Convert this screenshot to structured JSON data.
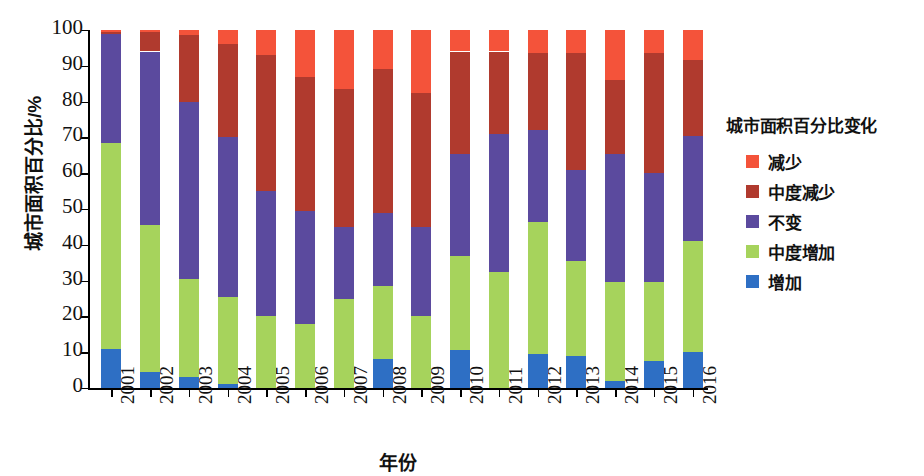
{
  "chart_data": {
    "type": "bar",
    "subtype": "stacked-percentage",
    "title": "",
    "xlabel": "年份",
    "ylabel": "城市面积百分比/%",
    "ylim": [
      0,
      100
    ],
    "yticks": [
      0,
      10,
      20,
      30,
      40,
      50,
      60,
      70,
      80,
      90,
      100
    ],
    "ytick_labels": [
      "0",
      "10",
      "20",
      "30",
      "40",
      "50",
      "60",
      "70",
      "80",
      "90",
      "100"
    ],
    "grid": false,
    "legend_position": "right",
    "legend_title": "城市面积百分比变化",
    "categories": [
      "2001",
      "2002",
      "2003",
      "2004",
      "2005",
      "2006",
      "2007",
      "2008",
      "2009",
      "2010",
      "2011",
      "2012",
      "2013",
      "2014",
      "2015",
      "2016"
    ],
    "stack_order_bottom_to_top": [
      "增加",
      "中度增加",
      "不变",
      "中度减少",
      "减少"
    ],
    "series": [
      {
        "name": "增加",
        "color": "#2E6FC4",
        "values": [
          11.0,
          4.5,
          3.0,
          1.0,
          0.0,
          0.0,
          0.0,
          8.0,
          0.0,
          10.5,
          0.0,
          9.5,
          9.0,
          2.0,
          7.5,
          10.0
        ]
      },
      {
        "name": "中度增加",
        "color": "#A6D35C",
        "values": [
          57.5,
          41.0,
          27.5,
          24.5,
          20.0,
          18.0,
          25.0,
          20.5,
          20.0,
          26.5,
          32.5,
          37.0,
          26.5,
          27.5,
          22.0,
          31.0
        ]
      },
      {
        "name": "不变",
        "color": "#5B4A9E",
        "values": [
          30.5,
          48.5,
          49.5,
          44.5,
          35.0,
          31.5,
          20.0,
          20.5,
          25.0,
          28.5,
          38.5,
          25.5,
          25.5,
          36.0,
          30.5,
          29.5
        ]
      },
      {
        "name": "中度减少",
        "color": "#B03A2E",
        "values": [
          0.5,
          5.5,
          18.5,
          26.0,
          38.0,
          37.5,
          38.5,
          40.0,
          37.5,
          28.5,
          23.0,
          21.5,
          32.5,
          20.5,
          33.5,
          21.0
        ]
      },
      {
        "name": "减少",
        "color": "#F4533A",
        "values": [
          0.5,
          0.5,
          1.5,
          4.0,
          7.0,
          13.0,
          16.5,
          11.0,
          17.5,
          6.0,
          6.0,
          6.5,
          6.5,
          14.0,
          6.5,
          8.5
        ]
      }
    ]
  },
  "legend": {
    "title": "城市面积百分比变化",
    "items": [
      {
        "label": "减少",
        "color": "#F4533A"
      },
      {
        "label": "中度减少",
        "color": "#B03A2E"
      },
      {
        "label": "不变",
        "color": "#5B4A9E"
      },
      {
        "label": "中度增加",
        "color": "#A6D35C"
      },
      {
        "label": "增加",
        "color": "#2E6FC4"
      }
    ]
  }
}
